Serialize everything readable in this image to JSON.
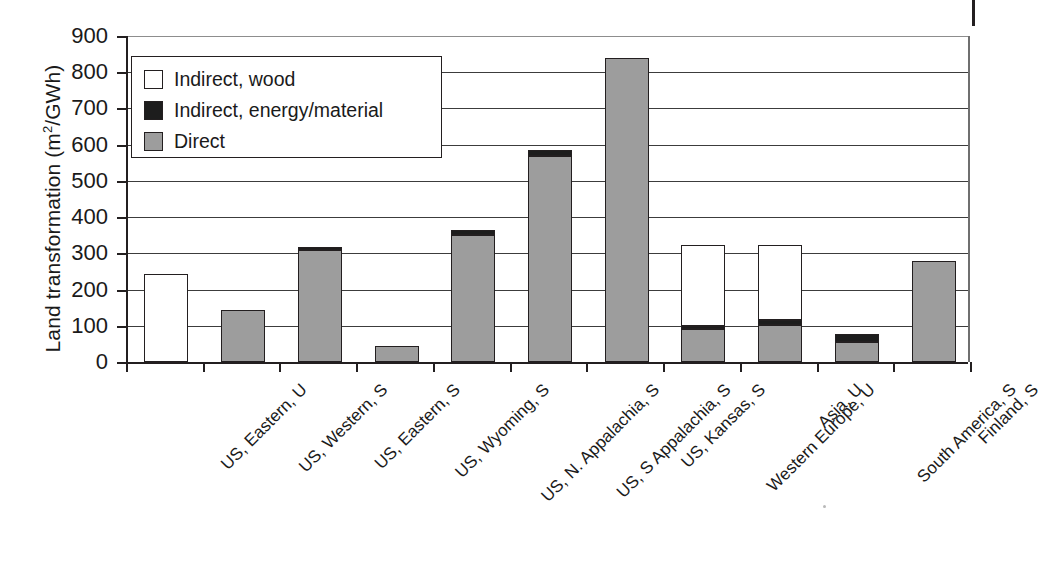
{
  "chart_data": {
    "type": "bar",
    "subtype": "stacked-vertical",
    "title": "",
    "xlabel": "",
    "ylabel": "Land transformation (m2/GWh)",
    "ylabel_parts": {
      "prefix": "Land transformation (m",
      "sup": "2",
      "suffix": "/GWh)"
    },
    "ylim": [
      0,
      900
    ],
    "ytick_step": 100,
    "yticks": [
      0,
      100,
      200,
      300,
      400,
      500,
      600,
      700,
      800,
      900
    ],
    "ytick_labels": [
      "0",
      "100",
      "200",
      "300",
      "400",
      "500",
      "600",
      "700",
      "800",
      "900"
    ],
    "grid": true,
    "grid_axis": "y",
    "legend_position": "upper-left-inside",
    "categories": [
      "US, Eastern, U",
      "US, Western, S",
      "US, Eastern, S",
      "US, Wyoming, S",
      "US, N. Appalachia, S",
      "US, S Appalachia, S",
      "US, Kansas, S",
      "Western Europe, U",
      "Asia, U",
      "South America, S",
      "Finland, S"
    ],
    "series": [
      {
        "name": "Direct",
        "color": "#9d9d9d",
        "values": [
          0,
          143,
          310,
          45,
          350,
          570,
          840,
          90,
          102,
          55,
          278
        ]
      },
      {
        "name": "Indirect, energy/material",
        "color": "#1d1d1d",
        "values": [
          0,
          0,
          8,
          0,
          14,
          15,
          0,
          10,
          15,
          23,
          0
        ]
      },
      {
        "name": "Indirect, wood",
        "color": "#ffffff",
        "values": [
          242,
          0,
          0,
          0,
          0,
          0,
          0,
          223,
          206,
          0,
          0
        ]
      }
    ],
    "totals": [
      242,
      143,
      318,
      45,
      364,
      585,
      840,
      323,
      323,
      78,
      278
    ]
  },
  "legend": {
    "items": [
      {
        "label": "Indirect, wood",
        "swatch": "wood"
      },
      {
        "label": "Indirect, energy/material",
        "swatch": "energy"
      },
      {
        "label": "Direct",
        "swatch": "direct"
      }
    ]
  }
}
